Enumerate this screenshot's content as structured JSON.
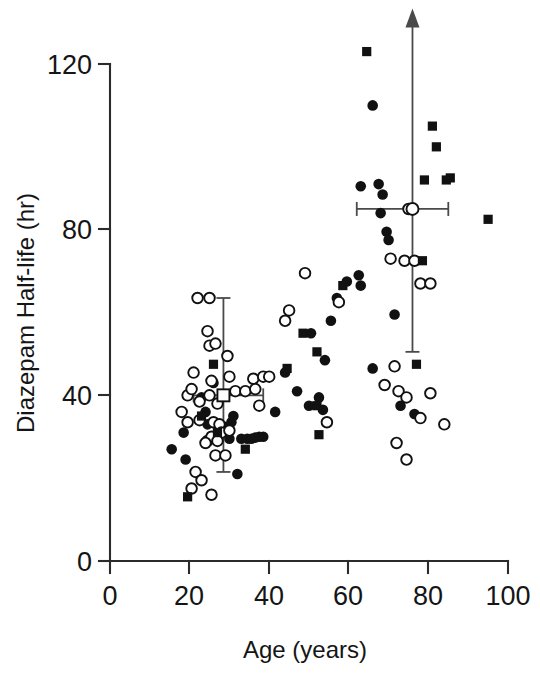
{
  "figure": {
    "domain": "chart",
    "background_color": "#ffffff",
    "ink_color": "#111111"
  },
  "chart_data": {
    "type": "scatter",
    "title": "",
    "subtitle": "",
    "xlabel": "Age (years)",
    "ylabel": "Diazepam Half-life (hr)",
    "xlim": [
      0,
      100
    ],
    "ylim": [
      0,
      130
    ],
    "xticks": [
      0,
      20,
      40,
      60,
      80,
      100
    ],
    "xtick_labels": [
      "0",
      "20",
      "40",
      "60",
      "80",
      "100"
    ],
    "yticks": [
      0,
      40,
      80,
      120
    ],
    "ytick_labels": [
      "0",
      "40",
      "80",
      "120"
    ],
    "grid": false,
    "legend": null,
    "legend_position": "none",
    "annotations": [
      {
        "name": "young-group-mean-marker",
        "marker": "open-square",
        "x": 28.5,
        "y": 40.0,
        "x_err_low": 21.0,
        "x_err_high": 38.5,
        "y_err_low": 21.5,
        "y_err_high": 63.5,
        "arrow_up": false
      },
      {
        "name": "elderly-group-mean-marker",
        "marker": "open-circle",
        "x": 76.0,
        "y": 85.0,
        "x_err_low": 62.0,
        "x_err_high": 85.0,
        "y_err_low": 50.5,
        "y_err_high": 130.0,
        "arrow_up": true
      }
    ],
    "series": [
      {
        "name": "filled-circle",
        "marker": "filled-circle",
        "points": [
          [
            15.5,
            27.0
          ],
          [
            18.5,
            31.0
          ],
          [
            19.0,
            24.5
          ],
          [
            23.0,
            39.5
          ],
          [
            24.0,
            36.0
          ],
          [
            24.5,
            33.0
          ],
          [
            26.0,
            43.0
          ],
          [
            27.0,
            30.0
          ],
          [
            28.5,
            32.5
          ],
          [
            30.0,
            29.5
          ],
          [
            30.5,
            33.5
          ],
          [
            31.0,
            35.0
          ],
          [
            33.0,
            29.5
          ],
          [
            34.5,
            29.5
          ],
          [
            35.5,
            29.5
          ],
          [
            36.5,
            29.8
          ],
          [
            37.5,
            30.0
          ],
          [
            38.5,
            30.0
          ],
          [
            32.0,
            21.0
          ],
          [
            41.5,
            36.0
          ],
          [
            44.0,
            45.5
          ],
          [
            47.0,
            41.0
          ],
          [
            50.0,
            37.5
          ],
          [
            50.5,
            55.0
          ],
          [
            52.5,
            39.5
          ],
          [
            53.5,
            36.5
          ],
          [
            54.0,
            48.5
          ],
          [
            55.5,
            58.0
          ],
          [
            57.0,
            63.5
          ],
          [
            59.5,
            67.5
          ],
          [
            62.5,
            69.0
          ],
          [
            63.0,
            66.5
          ],
          [
            66.0,
            110.0
          ],
          [
            67.5,
            91.0
          ],
          [
            68.5,
            88.5
          ],
          [
            68.0,
            84.0
          ],
          [
            69.5,
            79.5
          ],
          [
            70.0,
            77.5
          ],
          [
            71.5,
            59.5
          ],
          [
            66.0,
            46.5
          ],
          [
            73.0,
            37.5
          ],
          [
            76.5,
            35.5
          ],
          [
            63.0,
            90.5
          ]
        ]
      },
      {
        "name": "open-circle",
        "marker": "open-circle",
        "points": [
          [
            22.0,
            63.5
          ],
          [
            25.0,
            63.5
          ],
          [
            24.5,
            55.5
          ],
          [
            25.0,
            52.0
          ],
          [
            26.5,
            52.5
          ],
          [
            21.0,
            45.5
          ],
          [
            29.5,
            49.5
          ],
          [
            25.5,
            43.5
          ],
          [
            30.0,
            44.5
          ],
          [
            31.5,
            41.0
          ],
          [
            19.5,
            40.0
          ],
          [
            20.5,
            41.5
          ],
          [
            22.5,
            38.5
          ],
          [
            25.0,
            40.0
          ],
          [
            27.0,
            38.0
          ],
          [
            18.0,
            36.0
          ],
          [
            19.5,
            33.5
          ],
          [
            22.5,
            34.0
          ],
          [
            26.0,
            33.5
          ],
          [
            27.5,
            33.0
          ],
          [
            28.0,
            31.0
          ],
          [
            30.0,
            31.5
          ],
          [
            24.5,
            29.0
          ],
          [
            25.5,
            30.0
          ],
          [
            27.0,
            29.0
          ],
          [
            26.5,
            25.5
          ],
          [
            29.0,
            25.5
          ],
          [
            24.0,
            28.5
          ],
          [
            21.5,
            21.5
          ],
          [
            23.0,
            19.5
          ],
          [
            25.5,
            16.0
          ],
          [
            20.5,
            17.5
          ],
          [
            34.0,
            41.0
          ],
          [
            36.0,
            44.0
          ],
          [
            36.5,
            41.5
          ],
          [
            37.5,
            37.5
          ],
          [
            38.5,
            44.5
          ],
          [
            40.0,
            44.5
          ],
          [
            44.0,
            58.0
          ],
          [
            45.0,
            60.5
          ],
          [
            49.0,
            69.5
          ],
          [
            57.5,
            62.5
          ],
          [
            54.5,
            33.5
          ],
          [
            70.5,
            73.0
          ],
          [
            74.0,
            72.5
          ],
          [
            76.5,
            72.5
          ],
          [
            78.0,
            67.0
          ],
          [
            80.5,
            67.0
          ],
          [
            75.0,
            85.0
          ],
          [
            71.5,
            47.0
          ],
          [
            69.0,
            42.5
          ],
          [
            72.5,
            41.0
          ],
          [
            74.5,
            39.5
          ],
          [
            80.5,
            40.5
          ],
          [
            78.0,
            34.5
          ],
          [
            84.0,
            33.0
          ],
          [
            72.0,
            28.5
          ],
          [
            74.5,
            24.5
          ]
        ]
      },
      {
        "name": "filled-square",
        "marker": "filled-square",
        "points": [
          [
            19.5,
            15.5
          ],
          [
            26.0,
            47.5
          ],
          [
            23.0,
            35.0
          ],
          [
            27.0,
            31.0
          ],
          [
            34.0,
            27.0
          ],
          [
            44.5,
            46.5
          ],
          [
            48.5,
            55.0
          ],
          [
            52.0,
            50.5
          ],
          [
            52.0,
            37.5
          ],
          [
            52.5,
            30.5
          ],
          [
            58.5,
            66.5
          ],
          [
            64.5,
            123.0
          ],
          [
            81.0,
            105.0
          ],
          [
            82.0,
            100.0
          ],
          [
            79.0,
            92.0
          ],
          [
            84.5,
            92.0
          ],
          [
            85.5,
            92.5
          ],
          [
            95.0,
            82.5
          ],
          [
            78.5,
            72.5
          ],
          [
            77.0,
            47.5
          ]
        ]
      }
    ]
  },
  "axes": {
    "x_title": "Age (years)",
    "y_title": "Diazepam Half-life (hr)",
    "x_tick_labels": [
      "0",
      "20",
      "40",
      "60",
      "80",
      "100"
    ],
    "y_tick_labels": [
      "0",
      "40",
      "80",
      "120"
    ]
  }
}
